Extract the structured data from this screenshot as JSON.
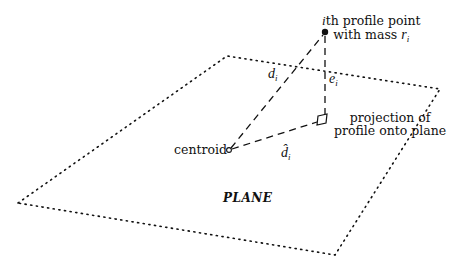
{
  "labels": {
    "point_line1_prefix": "i",
    "point_line1_rest": "th profile point",
    "point_line2_prefix": "with mass ",
    "point_line2_var": "r",
    "point_line2_sub": "i",
    "projection_line1": "projection of",
    "projection_line2": "profile onto plane",
    "centroid": "centroid",
    "plane": "PLANE",
    "d_var": "d",
    "d_sub": "i",
    "e_var": "e",
    "e_sub": "i",
    "dhat_var": "d̂",
    "dhat_sub": "i"
  },
  "geometry": {
    "plane_corners": [
      [
        18,
        203
      ],
      [
        227,
        56
      ],
      [
        440,
        89
      ],
      [
        335,
        255
      ]
    ],
    "profile_point": [
      325,
      32
    ],
    "projection_point": [
      325,
      118
    ],
    "centroid": [
      229,
      150
    ]
  },
  "colors": {
    "ink": "#111111",
    "background": "#ffffff"
  }
}
